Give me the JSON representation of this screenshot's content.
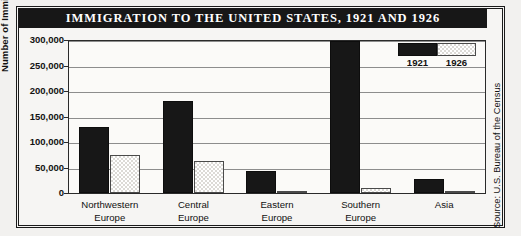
{
  "title": "IMMIGRATION TO THE UNITED STATES, 1921 AND 1926",
  "source_note": "Source: U.S. Bureau of the Census",
  "legend": {
    "series1": "1921",
    "series2": "1926"
  },
  "axis": {
    "ylabel": "Number of Immigrants",
    "yticks": [
      "300,000",
      "250,000",
      "200,000",
      "150,000",
      "100,000",
      "50,000",
      "0"
    ]
  },
  "categories_display": [
    {
      "line1": "Northwestern",
      "line2": "Europe"
    },
    {
      "line1": "Central",
      "line2": "Europe"
    },
    {
      "line1": "Eastern",
      "line2": "Europe"
    },
    {
      "line1": "Southern",
      "line2": "Europe"
    },
    {
      "line1": "Asia",
      "line2": ""
    }
  ],
  "colors": {
    "series_1921": "#171717",
    "series_1926": "#dcdad6",
    "title_bar": "#171717",
    "background": "#f6f5f3",
    "gridline": "#8d8d8d"
  },
  "chart_data": {
    "type": "bar",
    "title": "IMMIGRATION TO THE UNITED STATES, 1921 AND 1926",
    "xlabel": "",
    "ylabel": "Number of Immigrants",
    "ylim": [
      0,
      300000
    ],
    "ytick_values": [
      0,
      50000,
      100000,
      150000,
      200000,
      250000,
      300000
    ],
    "grid": true,
    "legend_position": "top-right",
    "categories": [
      "Northwestern Europe",
      "Central Europe",
      "Eastern Europe",
      "Southern Europe",
      "Asia"
    ],
    "series": [
      {
        "name": "1921",
        "values": [
          130000,
          180000,
          44000,
          298000,
          27000
        ]
      },
      {
        "name": "1926",
        "values": [
          75000,
          62000,
          3000,
          10000,
          1000
        ]
      }
    ]
  }
}
